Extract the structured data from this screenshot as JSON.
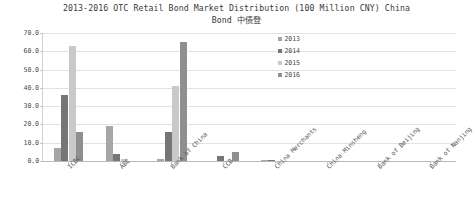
{
  "chart_data": {
    "type": "bar",
    "title": "2013-2016 OTC Retail Bond Market Distribution (100 Million CNY) China\nBond 中债登",
    "xlabel": "",
    "ylabel": "",
    "ylim": [
      0,
      70
    ],
    "yticks": [
      "0.0",
      "10.0",
      "20.0",
      "30.0",
      "40.0",
      "50.0",
      "60.0",
      "70.0"
    ],
    "ytick_values": [
      0,
      10,
      20,
      30,
      40,
      50,
      60,
      70
    ],
    "grid": true,
    "legend_position": "center",
    "categories": [
      "ICBC",
      "ABC",
      "Bank of China",
      "CCB",
      "China Merchants",
      "China Minsheng",
      "Bank of Beijing",
      "Bank of Nanjing"
    ],
    "series": [
      {
        "name": "2013",
        "color": "#a6a6a6",
        "values": [
          7.0,
          19.0,
          1.0,
          0.0,
          0.3,
          0.0,
          0.0,
          0.0
        ]
      },
      {
        "name": "2014",
        "color": "#767676",
        "values": [
          36.0,
          4.0,
          16.0,
          3.0,
          0.4,
          0.0,
          0.0,
          0.0
        ]
      },
      {
        "name": "2015",
        "color": "#c9c9c9",
        "values": [
          63.0,
          1.0,
          41.0,
          0.0,
          0.0,
          0.0,
          0.0,
          0.0
        ]
      },
      {
        "name": "2016",
        "color": "#8f8f8f",
        "values": [
          16.0,
          0.0,
          65.0,
          5.0,
          0.0,
          0.0,
          0.0,
          0.0
        ]
      }
    ]
  }
}
